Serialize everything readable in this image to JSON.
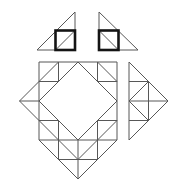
{
  "figure": {
    "canvas": {
      "width": 175,
      "height": 187,
      "background": "#ffffff"
    },
    "style": {
      "thin_color": "#575757",
      "thin_width": 1,
      "bold_color": "#141414",
      "bold_width": 2.6
    },
    "parts": [
      {
        "name": "top-left-triangle",
        "segments": [
          [
            37,
            50,
            75,
            50
          ],
          [
            75,
            12,
            75,
            50
          ],
          [
            37,
            50,
            75,
            12
          ],
          [
            55.5,
            50,
            75,
            30.5
          ]
        ]
      },
      {
        "name": "top-left-bold-square",
        "bold": true,
        "rect": [
          55.5,
          30.5,
          19.5,
          19.5
        ]
      },
      {
        "name": "top-right-triangle",
        "segments": [
          [
            99,
            50,
            138,
            50
          ],
          [
            99,
            12,
            99,
            50
          ],
          [
            99,
            12,
            138,
            50
          ],
          [
            99,
            30.5,
            118.5,
            50
          ]
        ]
      },
      {
        "name": "top-right-bold-square",
        "bold": true,
        "rect": [
          99,
          30.5,
          19.5,
          19.5
        ]
      },
      {
        "name": "main-diamond-lattice",
        "segments": [
          [
            19.5,
            101,
            39,
            81.5
          ],
          [
            39,
            120.5,
            19.5,
            101
          ],
          [
            39,
            62,
            117,
            62
          ],
          [
            117,
            62,
            117,
            140
          ],
          [
            117,
            140,
            78,
            179
          ],
          [
            78,
            179,
            39,
            140
          ],
          [
            39,
            62,
            39,
            140
          ],
          [
            39,
            101,
            78,
            62
          ],
          [
            78,
            62,
            117,
            101
          ],
          [
            117,
            101,
            78,
            140
          ],
          [
            78,
            140,
            39,
            101
          ],
          [
            39,
            81.5,
            58.5,
            62
          ],
          [
            97.5,
            62,
            117,
            81.5
          ],
          [
            39,
            120.5,
            58.5,
            140
          ],
          [
            97.5,
            140,
            117,
            120.5
          ],
          [
            58.5,
            140,
            78,
            159.5
          ],
          [
            78,
            159.5,
            97.5,
            140
          ],
          [
            58.5,
            62,
            58.5,
            81.5
          ],
          [
            58.5,
            120.5,
            58.5,
            159.5
          ],
          [
            78,
            140,
            78,
            179
          ],
          [
            97.5,
            62,
            97.5,
            81.5
          ],
          [
            97.5,
            120.5,
            97.5,
            159.5
          ],
          [
            19.5,
            101,
            39,
            101
          ],
          [
            39,
            81.5,
            58.5,
            81.5
          ],
          [
            97.5,
            81.5,
            117,
            81.5
          ],
          [
            39,
            120.5,
            58.5,
            120.5
          ],
          [
            97.5,
            120.5,
            117,
            120.5
          ],
          [
            39,
            140,
            117,
            140
          ],
          [
            58.5,
            159.5,
            97.5,
            159.5
          ]
        ]
      },
      {
        "name": "detached-right-triangle",
        "segments": [
          [
            129,
            62,
            129,
            140
          ],
          [
            129,
            62,
            168,
            101
          ],
          [
            129,
            140,
            168,
            101
          ],
          [
            129,
            81.5,
            148.5,
            81.5
          ],
          [
            129,
            101,
            168,
            101
          ],
          [
            129,
            120.5,
            148.5,
            120.5
          ],
          [
            148.5,
            81.5,
            148.5,
            120.5
          ],
          [
            148.5,
            81.5,
            129,
            101
          ],
          [
            129,
            101,
            148.5,
            120.5
          ]
        ]
      }
    ]
  }
}
